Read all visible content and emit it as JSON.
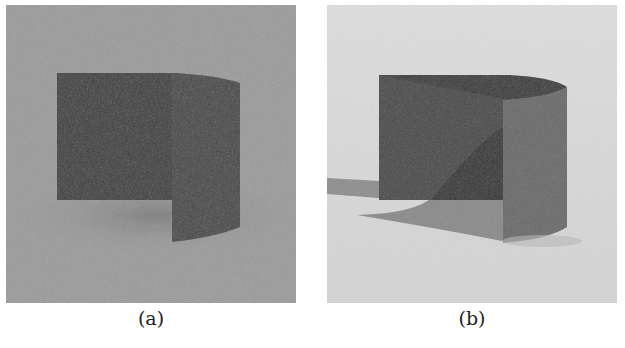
{
  "figure": {
    "panels": [
      {
        "id": "a",
        "caption": "(a)",
        "description": "Rendered curved wall, uniform ambient lighting",
        "colors": {
          "background": "#9b9b9b",
          "floor_shadow": "#858585",
          "wall_back": "#3d3d3d",
          "wall_side": "#4a4a4a"
        }
      },
      {
        "id": "b",
        "caption": "(b)",
        "description": "Rendered curved wall, directional lighting with cast shadow",
        "colors": {
          "background": "#d9d9d9",
          "shadow": "#8a8a8a",
          "wall_back": "#4b4b4b",
          "wall_side": "#6a6a6a",
          "inner_shadow": "#353535"
        }
      }
    ]
  }
}
